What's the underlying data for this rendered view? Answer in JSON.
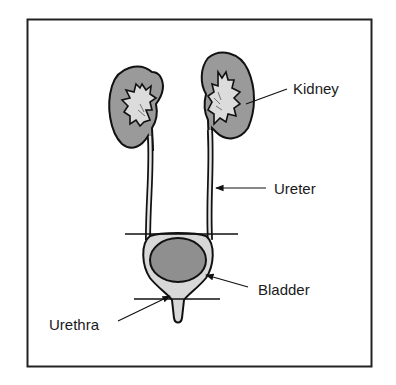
{
  "diagram": {
    "labels": {
      "kidney": "Kidney",
      "ureter": "Ureter",
      "bladder": "Bladder",
      "urethra": "Urethra"
    },
    "colors": {
      "outline": "#111111",
      "kidney_cortex": "#9a9a9a",
      "kidney_pelvis": "#dcdcdc",
      "bladder_fill": "#8f8f8f",
      "tube_fill": "#cfcfcf",
      "frame": "#222222",
      "background": "#ffffff"
    }
  }
}
